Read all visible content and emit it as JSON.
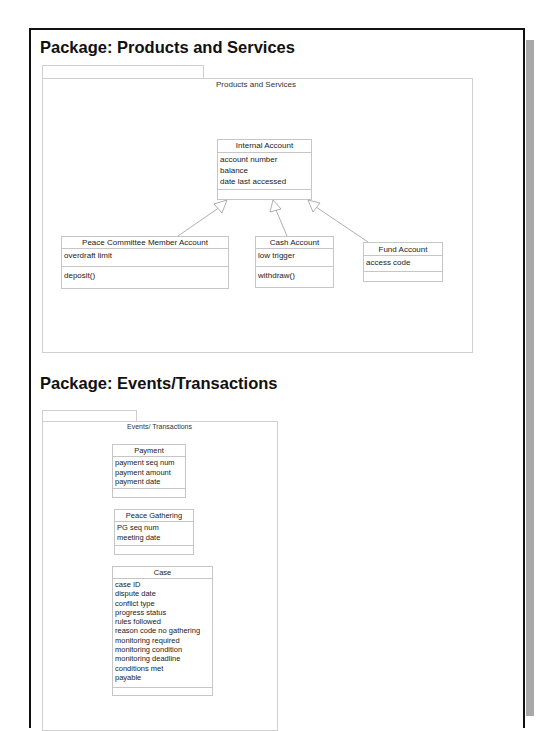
{
  "packages": [
    {
      "heading": "Package: Products and Services",
      "frame_label": "Products and Services",
      "classes": [
        {
          "name": "Internal Account",
          "attributes": [
            "account number",
            "balance",
            "date last accessed"
          ],
          "operations": []
        },
        {
          "name": "Peace Committee Member Account",
          "attributes": [
            "overdraft limit"
          ],
          "operations": [
            "deposit()"
          ]
        },
        {
          "name": "Cash Account",
          "attributes": [
            "low trigger"
          ],
          "operations": [
            "withdraw()"
          ]
        },
        {
          "name": "Fund Account",
          "attributes": [
            "access code"
          ],
          "operations": []
        }
      ],
      "relationships": [
        {
          "type": "generalization",
          "from": "Peace Committee Member Account",
          "to": "Internal Account"
        },
        {
          "type": "generalization",
          "from": "Cash Account",
          "to": "Internal Account"
        },
        {
          "type": "generalization",
          "from": "Fund Account",
          "to": "Internal Account"
        }
      ]
    },
    {
      "heading": "Package: Events/Transactions",
      "frame_label": "Events/ Transactions",
      "classes": [
        {
          "name": "Payment",
          "attributes": [
            "payment seq num",
            "payment amount",
            "payment date"
          ],
          "operations": []
        },
        {
          "name": "Peace Gathering",
          "attributes": [
            "PG seq num",
            "meeting date"
          ],
          "operations": []
        },
        {
          "name": "Case",
          "attributes": [
            "case ID",
            "dispute date",
            "conflict type",
            "progress status",
            "rules followed",
            "reason code no gathering",
            "monitoring required",
            "monitoring condition",
            "monitoring deadline",
            "conditions met",
            "payable"
          ],
          "operations": []
        }
      ],
      "relationships": []
    }
  ],
  "colors": {
    "frame": "#111111",
    "shadow": "#a8a8a8",
    "box_border": "#c6c6c6",
    "arrow": "#9a9a9a"
  }
}
